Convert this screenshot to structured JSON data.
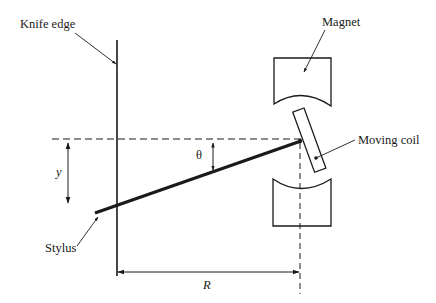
{
  "diagram": {
    "labels": {
      "knife_edge": "Knife edge",
      "magnet": "Magnet",
      "moving_coil": "Moving coil",
      "stylus": "Stylus",
      "y": "y",
      "theta": "θ",
      "R": "R"
    },
    "colors": {
      "stroke": "#1a1a1a",
      "background": "#ffffff"
    }
  }
}
